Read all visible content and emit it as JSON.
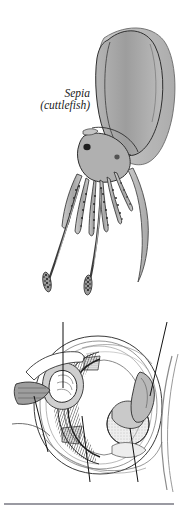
{
  "figure": {
    "name": "cephalopod-eye-figure",
    "background_color": "#ffffff",
    "ink_color": "#1a1a1a"
  },
  "organism": {
    "species_name": "Sepia",
    "common_name": "(cuttlefish)",
    "body_fill": "#a9a9a9",
    "body_fill_light": "#c4c4c4",
    "outline_color": "#2b2b2b",
    "parts": {
      "mantle": "mantle",
      "fin": "lateral-fin",
      "head": "head",
      "eye": "eye",
      "arms": "arms",
      "tentacles": "feeding-tentacles",
      "tentacle_club": "tentacle-club"
    }
  },
  "eye_diagram": {
    "title": "cephalopod eye cross-section",
    "labels": [
      {
        "id": "optic-ganglion",
        "text": "Optic ganglion"
      },
      {
        "id": "iris",
        "text": "Iris"
      },
      {
        "id": "optic-nerve",
        "text": "Optic nerve"
      },
      {
        "id": "retina",
        "text": "Retina"
      },
      {
        "id": "lens",
        "text": "Lens"
      },
      {
        "id": "cornea",
        "text": "Cornea"
      }
    ],
    "structures": {
      "lens_fill": "#d8d8d8",
      "retina_band": "#2a2a2a",
      "ganglion_fill": "#8f8f8f",
      "cartilage_fill": "#bdbdbd"
    }
  },
  "divider": {
    "name": "footer-rule",
    "color": "#9a9aa2"
  }
}
